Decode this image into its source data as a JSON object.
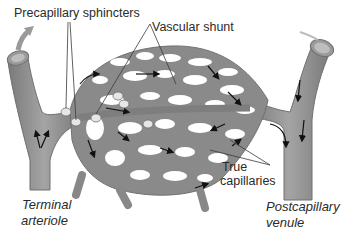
{
  "diagram": {
    "type": "capillary-bed",
    "labels": {
      "precapillary_sphincters": "Precapillary sphincters",
      "vascular_shunt": "Vascular shunt",
      "true_capillaries_1": "True",
      "true_capillaries_2": "capillaries",
      "terminal_arteriole_1": "Terminal",
      "terminal_arteriole_2": "arteriole",
      "postcapillary_venule_1": "Postcapillary",
      "postcapillary_venule_2": "venule"
    },
    "colors": {
      "vessel": "#8c8c8c",
      "vessel_dark": "#6e6e6e",
      "vessel_light": "#a8a8a8",
      "background": "#ffffff",
      "text": "#2a2a2a",
      "arrow": "#111111",
      "leader_line": "#3a3a3a"
    }
  }
}
